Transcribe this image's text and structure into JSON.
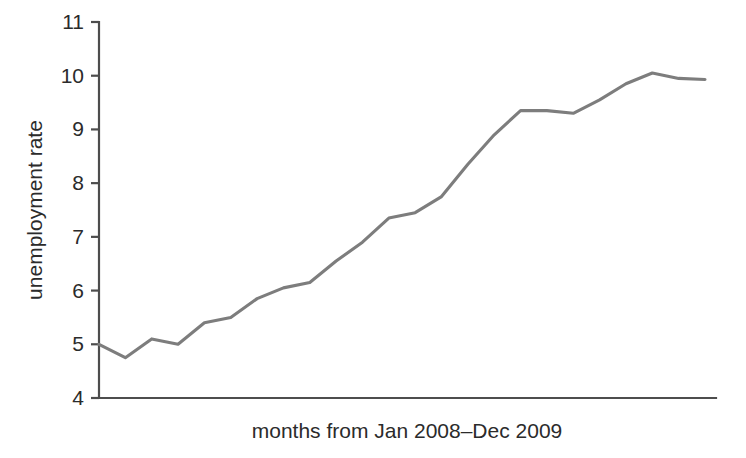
{
  "chart_data": {
    "type": "line",
    "title": "",
    "subtitle": "",
    "xlabel": "months from Jan 2008–Dec 2009",
    "ylabel": "unemployment rate",
    "x": [
      1,
      2,
      3,
      4,
      5,
      6,
      7,
      8,
      9,
      10,
      11,
      12,
      13,
      14,
      15,
      16,
      17,
      18,
      19,
      20,
      21,
      22,
      23,
      24
    ],
    "x_tick_labels": [],
    "categories": [
      "Jan 2008",
      "Feb 2008",
      "Mar 2008",
      "Apr 2008",
      "May 2008",
      "Jun 2008",
      "Jul 2008",
      "Aug 2008",
      "Sep 2008",
      "Oct 2008",
      "Nov 2008",
      "Dec 2008",
      "Jan 2009",
      "Feb 2009",
      "Mar 2009",
      "Apr 2009",
      "May 2009",
      "Jun 2009",
      "Jul 2009",
      "Aug 2009",
      "Sep 2009",
      "Oct 2009",
      "Nov 2009",
      "Dec 2009"
    ],
    "values": [
      5.0,
      4.75,
      5.1,
      5.0,
      5.4,
      5.5,
      5.85,
      6.05,
      6.15,
      6.55,
      6.9,
      7.35,
      7.45,
      7.75,
      8.35,
      8.9,
      9.35,
      9.35,
      9.3,
      9.55,
      9.85,
      10.05,
      9.95,
      9.93
    ],
    "ylim": [
      4,
      11
    ],
    "y_ticks": [
      4,
      5,
      6,
      7,
      8,
      9,
      10,
      11
    ],
    "y_tick_labels": [
      "4",
      "5",
      "6",
      "7",
      "8",
      "9",
      "10",
      "11"
    ],
    "xlim": [
      1,
      24
    ],
    "grid": false,
    "legend": false,
    "legend_position": "none",
    "series": [
      {
        "name": "unemployment rate",
        "color": "#7d7d7d",
        "values": [
          5.0,
          4.75,
          5.1,
          5.0,
          5.4,
          5.5,
          5.85,
          6.05,
          6.15,
          6.55,
          6.9,
          7.35,
          7.45,
          7.75,
          8.35,
          8.9,
          9.35,
          9.35,
          9.3,
          9.55,
          9.85,
          10.05,
          9.95,
          9.93
        ]
      }
    ],
    "colors": {
      "line": "#7d7d7d",
      "axis": "#4d4d4d",
      "text": "#2b2b2b",
      "background": "#ffffff"
    }
  }
}
